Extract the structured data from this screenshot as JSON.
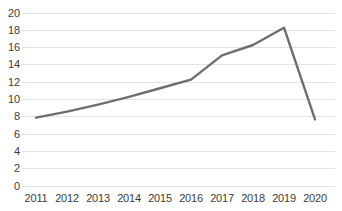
{
  "chart_data": {
    "type": "line",
    "title": "",
    "subtitle": "",
    "xlabel": "",
    "ylabel": "",
    "categories": [
      "2011",
      "2012",
      "2013",
      "2014",
      "2015",
      "2016",
      "2017",
      "2018",
      "2019",
      "2020"
    ],
    "values": [
      7.9,
      8.6,
      9.4,
      10.3,
      11.3,
      12.3,
      15.1,
      16.3,
      18.3,
      7.7
    ],
    "series": [
      {
        "name": "",
        "values": [
          7.9,
          8.6,
          9.4,
          10.3,
          11.3,
          12.3,
          15.1,
          16.3,
          18.3,
          7.7
        ]
      }
    ],
    "ylim": [
      0,
      20
    ],
    "ytick_values": [
      0,
      2,
      4,
      6,
      8,
      10,
      12,
      14,
      16,
      18,
      20
    ],
    "ytick_labels": [
      "0",
      "2",
      "4",
      "6",
      "8",
      "10",
      "12",
      "14",
      "16",
      "18",
      "20"
    ],
    "xtick_labels": [
      "2011",
      "2012",
      "2013",
      "2014",
      "2015",
      "2016",
      "2017",
      "2018",
      "2019",
      "2020"
    ],
    "grid": {
      "horizontal": true,
      "vertical": false
    },
    "legend": {
      "visible": false,
      "position": "none"
    },
    "markers": false,
    "annotations": [],
    "colors": {
      "line": "#6e6e6e",
      "gridline": "#e2e2e2",
      "axis_text": "#3b3b3b",
      "background": "#ffffff"
    }
  }
}
